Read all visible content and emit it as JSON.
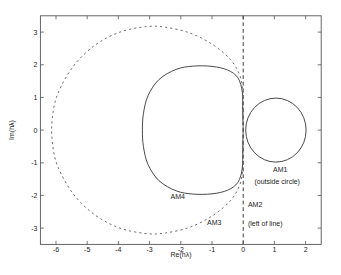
{
  "chart_data": {
    "type": "line",
    "title": "",
    "xlabel": "Re(hλ)",
    "ylabel": "Im(hλ)",
    "xlim": [
      -6.5,
      2.5
    ],
    "ylim": [
      -3.5,
      3.5
    ],
    "x_ticks": [
      -6,
      -5,
      -4,
      -3,
      -2,
      -1,
      0,
      1,
      2
    ],
    "y_ticks": [
      -3,
      -2,
      -1,
      0,
      1,
      2,
      3
    ],
    "grid": false,
    "legend": "none",
    "colors": {
      "curve": "#4a4a4a",
      "dashed": "#6e6e6e",
      "frame": "#555555",
      "text": "#1c1c1c"
    },
    "series": [
      {
        "name": "AM1-stability-boundary",
        "style": "solid",
        "shape": "circle",
        "center": [
          1,
          0
        ],
        "radius": 1
      },
      {
        "name": "AM2-stability-boundary",
        "style": "dashed",
        "shape": "vline",
        "x": 0
      },
      {
        "name": "AM3-stability-boundary",
        "style": "dashed",
        "shape": "curve",
        "real_axis_crossings": [
          0,
          -6.1
        ],
        "points": [
          [
            0,
            0
          ],
          [
            -0.01,
            0.7
          ],
          [
            -0.02,
            1.25
          ],
          [
            -0.12,
            1.7
          ],
          [
            -0.4,
            2.15
          ],
          [
            -0.95,
            2.6
          ],
          [
            -1.7,
            2.97
          ],
          [
            -2.5,
            3.15
          ],
          [
            -3.1,
            3.17
          ],
          [
            -3.95,
            3.0
          ],
          [
            -4.75,
            2.6
          ],
          [
            -5.45,
            1.95
          ],
          [
            -5.95,
            1.1
          ],
          [
            -6.12,
            0.35
          ],
          [
            -6.12,
            -0.35
          ],
          [
            -5.95,
            -1.1
          ],
          [
            -5.45,
            -1.95
          ],
          [
            -4.75,
            -2.6
          ],
          [
            -3.95,
            -3.0
          ],
          [
            -3.1,
            -3.17
          ],
          [
            -2.5,
            -3.15
          ],
          [
            -1.7,
            -2.97
          ],
          [
            -0.95,
            -2.6
          ],
          [
            -0.4,
            -2.15
          ],
          [
            -0.12,
            -1.7
          ],
          [
            -0.02,
            -1.25
          ],
          [
            -0.01,
            -0.7
          ],
          [
            0,
            0
          ]
        ]
      },
      {
        "name": "AM4-stability-boundary",
        "style": "solid",
        "shape": "curve",
        "real_axis_crossings": [
          0,
          -3.2
        ],
        "points": [
          [
            0,
            0
          ],
          [
            -0.015,
            0.6
          ],
          [
            -0.03,
            1.16
          ],
          [
            -0.17,
            1.6
          ],
          [
            -0.5,
            1.84
          ],
          [
            -1.0,
            1.95
          ],
          [
            -1.6,
            1.96
          ],
          [
            -2.15,
            1.86
          ],
          [
            -2.7,
            1.55
          ],
          [
            -3.05,
            1.05
          ],
          [
            -3.2,
            0.5
          ],
          [
            -3.23,
            0
          ],
          [
            -3.2,
            -0.5
          ],
          [
            -3.05,
            -1.05
          ],
          [
            -2.7,
            -1.55
          ],
          [
            -2.15,
            -1.86
          ],
          [
            -1.6,
            -1.96
          ],
          [
            -1.0,
            -1.95
          ],
          [
            -0.5,
            -1.84
          ],
          [
            -0.17,
            -1.6
          ],
          [
            -0.03,
            -1.16
          ],
          [
            -0.015,
            -0.6
          ],
          [
            0,
            0
          ]
        ]
      }
    ],
    "annotations": [
      {
        "text": "AM1",
        "x": 1.19,
        "y": -1.19,
        "anchor": "middle"
      },
      {
        "text": "(outside circle)",
        "x": 1.09,
        "y": -1.56,
        "anchor": "middle"
      },
      {
        "text": "AM2",
        "x": 0.15,
        "y": -2.28,
        "anchor": "start"
      },
      {
        "text": "(left of line)",
        "x": 0.15,
        "y": -2.85,
        "anchor": "start"
      },
      {
        "text": "AM3",
        "x": -0.93,
        "y": -2.83,
        "anchor": "middle"
      },
      {
        "text": "AM4",
        "x": -2.1,
        "y": -2.02,
        "anchor": "middle"
      }
    ]
  }
}
